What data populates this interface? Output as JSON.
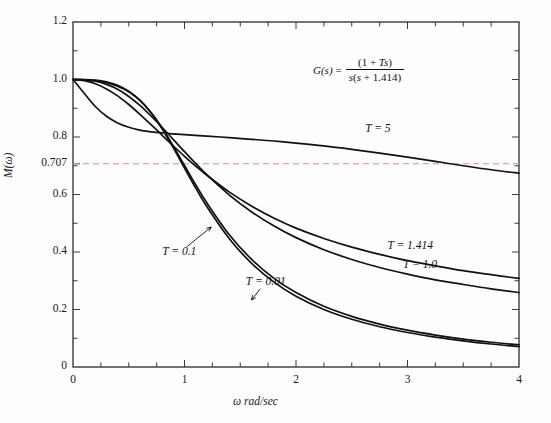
{
  "chart_data": {
    "type": "line",
    "title": "",
    "xlabel": "ω rad/sec",
    "ylabel": "M(ω)",
    "xlim": [
      0,
      4
    ],
    "ylim": [
      0,
      1.2
    ],
    "grid": false,
    "legend_position": "inline-curve-labels",
    "xticks": [
      0,
      1,
      2,
      3,
      4
    ],
    "xtick_labels": [
      "0",
      "1",
      "2",
      "3",
      "4"
    ],
    "xminor_step": 0.25,
    "yticks": [
      0,
      0.2,
      0.4,
      0.6,
      0.707,
      0.8,
      1.0,
      1.2
    ],
    "ytick_labels": [
      "0",
      "0.2",
      "0.4",
      "0.6",
      "0.707",
      "0.8",
      "1.0",
      "1.2"
    ],
    "yminor_step": 0.1,
    "annotations": [
      {
        "name": "transfer-function",
        "text": "G(s) = (1 + Ts) / (s(s + 1.414))",
        "x": 2.5,
        "y": 1.06
      }
    ],
    "reference_lines": [
      {
        "name": "half-power-line",
        "value": 0.707,
        "orientation": "horizontal",
        "style": "dashed",
        "color": "#e08a8a",
        "label": "0.707"
      }
    ],
    "series": [
      {
        "name": "T = 5",
        "label": "T = 5",
        "label_x": 2.62,
        "label_y": 0.826,
        "color": "#111111",
        "x": [
          0,
          0.1,
          0.2,
          0.3,
          0.4,
          0.5,
          0.6,
          0.7,
          0.8,
          0.9,
          1.0,
          1.2,
          1.4,
          1.6,
          1.8,
          2.0,
          2.25,
          2.5,
          2.75,
          3.0,
          3.25,
          3.5,
          3.75,
          4.0
        ],
        "y": [
          1.0,
          0.952,
          0.906,
          0.872,
          0.849,
          0.834,
          0.824,
          0.818,
          0.814,
          0.811,
          0.808,
          0.803,
          0.798,
          0.792,
          0.786,
          0.779,
          0.769,
          0.757,
          0.744,
          0.73,
          0.715,
          0.7,
          0.686,
          0.674
        ]
      },
      {
        "name": "T = 1.414",
        "label": "T = 1.414",
        "label_x": 2.82,
        "label_y": 0.418,
        "color": "#111111",
        "x": [
          0,
          0.1,
          0.2,
          0.3,
          0.4,
          0.5,
          0.6,
          0.7,
          0.8,
          0.9,
          1.0,
          1.1,
          1.2,
          1.4,
          1.6,
          1.8,
          2.0,
          2.25,
          2.5,
          2.75,
          3.0,
          3.25,
          3.5,
          3.75,
          4.0
        ],
        "y": [
          1.0,
          0.996,
          0.985,
          0.967,
          0.943,
          0.913,
          0.879,
          0.843,
          0.806,
          0.769,
          0.733,
          0.699,
          0.667,
          0.609,
          0.56,
          0.518,
          0.483,
          0.447,
          0.417,
          0.392,
          0.37,
          0.352,
          0.335,
          0.321,
          0.308
        ]
      },
      {
        "name": "T = 1.0",
        "label": "T = 1.0",
        "label_x": 2.96,
        "label_y": 0.352,
        "color": "#111111",
        "x": [
          0,
          0.1,
          0.2,
          0.3,
          0.4,
          0.5,
          0.6,
          0.7,
          0.8,
          0.9,
          1.0,
          1.1,
          1.2,
          1.4,
          1.6,
          1.8,
          2.0,
          2.25,
          2.5,
          2.75,
          3.0,
          3.25,
          3.5,
          3.75,
          4.0
        ],
        "y": [
          1.0,
          0.999,
          0.994,
          0.983,
          0.966,
          0.941,
          0.91,
          0.873,
          0.833,
          0.791,
          0.749,
          0.708,
          0.669,
          0.599,
          0.54,
          0.491,
          0.45,
          0.408,
          0.374,
          0.346,
          0.323,
          0.303,
          0.287,
          0.272,
          0.259
        ]
      },
      {
        "name": "T = 0.1",
        "label": "T = 0.1",
        "label_x": 0.8,
        "label_y": 0.398,
        "color": "#111111",
        "leader": {
          "from_x": 1.02,
          "from_y": 0.418,
          "to_x": 1.24,
          "to_y": 0.487
        },
        "x": [
          0,
          0.1,
          0.2,
          0.3,
          0.4,
          0.5,
          0.6,
          0.7,
          0.8,
          0.9,
          1.0,
          1.1,
          1.2,
          1.4,
          1.6,
          1.8,
          2.0,
          2.25,
          2.5,
          2.75,
          3.0,
          3.25,
          3.5,
          3.75,
          4.0
        ],
        "y": [
          1.0,
          0.999,
          0.996,
          0.989,
          0.977,
          0.957,
          0.927,
          0.885,
          0.831,
          0.768,
          0.701,
          0.634,
          0.571,
          0.461,
          0.375,
          0.309,
          0.259,
          0.211,
          0.176,
          0.149,
          0.128,
          0.111,
          0.097,
          0.086,
          0.077
        ]
      },
      {
        "name": "T = 0.01",
        "label": "T = 0.01",
        "label_x": 1.55,
        "label_y": 0.293,
        "color": "#111111",
        "leader": {
          "from_x": 1.68,
          "from_y": 0.272,
          "to_x": 1.6,
          "to_y": 0.233
        },
        "x": [
          0,
          0.1,
          0.2,
          0.3,
          0.4,
          0.5,
          0.6,
          0.7,
          0.8,
          0.9,
          1.0,
          1.1,
          1.2,
          1.4,
          1.6,
          1.8,
          2.0,
          2.25,
          2.5,
          2.75,
          3.0,
          3.25,
          3.5,
          3.75,
          4.0
        ],
        "y": [
          1.0,
          1.0,
          0.998,
          0.992,
          0.98,
          0.959,
          0.928,
          0.884,
          0.828,
          0.762,
          0.692,
          0.623,
          0.558,
          0.447,
          0.361,
          0.296,
          0.246,
          0.2,
          0.166,
          0.14,
          0.12,
          0.104,
          0.091,
          0.08,
          0.071
        ]
      }
    ]
  },
  "plot_area": {
    "left_px": 73,
    "right_px": 519,
    "top_px": 22,
    "bottom_px": 367,
    "frame_color": "#3a3a3a"
  }
}
